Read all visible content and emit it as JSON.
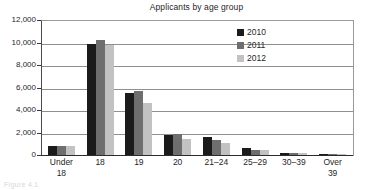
{
  "chart_data": {
    "type": "bar",
    "title": "Applicants by age group",
    "xlabel": "",
    "ylabel": "",
    "ylim": [
      0,
      12000
    ],
    "ytick_values": [
      0,
      2000,
      4000,
      6000,
      8000,
      10000,
      12000
    ],
    "ytick_labels": [
      "0",
      "2,000",
      "4,000",
      "6,000",
      "8,000",
      "10,000",
      "12,000"
    ],
    "grid": true,
    "legend_position": "top-right",
    "categories": [
      "Under\n18",
      "18",
      "19",
      "20",
      "21–24",
      "25–29",
      "30–39",
      "Over\n39"
    ],
    "series": [
      {
        "name": "2010",
        "color": "#1b1b1b",
        "values": [
          800,
          9850,
          5500,
          1750,
          1600,
          600,
          200,
          60
        ]
      },
      {
        "name": "2011",
        "color": "#6e6e6e",
        "values": [
          790,
          10200,
          5700,
          1880,
          1350,
          420,
          180,
          55
        ]
      },
      {
        "name": "2012",
        "color": "#c2c2c2",
        "values": [
          780,
          9750,
          4600,
          1450,
          1050,
          450,
          160,
          45
        ]
      }
    ]
  },
  "caption": {
    "ghost_text": "Figure 4.1"
  }
}
